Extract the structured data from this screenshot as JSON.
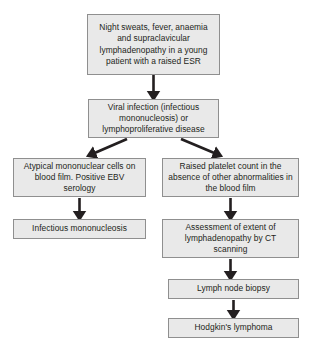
{
  "diagram": {
    "type": "flowchart",
    "background_color": "#ffffff",
    "node_fill_color": "#e9e9e9",
    "node_border_color": "#8f8f8f",
    "text_color": "#231f20",
    "arrow_color": "#231f20",
    "nodes": [
      {
        "id": "presentation",
        "label": "Night sweats, fever, anaemia and supraclavicular lymphadenopathy in a young patient with a raised ESR",
        "x": 87,
        "y": 14,
        "w": 133,
        "h": 61
      },
      {
        "id": "differential",
        "label": "Viral infection (infectious mononucleosis) or lymphoproliferative disease",
        "x": 88,
        "y": 99,
        "w": 131,
        "h": 39
      },
      {
        "id": "left-finding",
        "label": "Atypical mononuclear cells on blood film. Positive EBV serology",
        "x": 13,
        "y": 158,
        "w": 133,
        "h": 39
      },
      {
        "id": "right-finding",
        "label": "Raised platelet count in the absence of other abnormalities in the blood film",
        "x": 162,
        "y": 158,
        "w": 137,
        "h": 39
      },
      {
        "id": "left-diagnosis",
        "label": "Infectious mononucleosis",
        "x": 13,
        "y": 219,
        "w": 133,
        "h": 20
      },
      {
        "id": "ct-assessment",
        "label": "Assessment of extent of lymphadenopathy by CT scanning",
        "x": 162,
        "y": 219,
        "w": 137,
        "h": 39
      },
      {
        "id": "biopsy",
        "label": "Lymph node biopsy",
        "x": 168,
        "y": 279,
        "w": 131,
        "h": 20
      },
      {
        "id": "final-diagnosis",
        "label": "Hodgkin's lymphoma",
        "x": 168,
        "y": 318,
        "w": 131,
        "h": 20
      }
    ],
    "edges": [
      {
        "id": "presentation-to-differential",
        "from": "presentation",
        "to": "differential",
        "x1": 153.5,
        "y1": 75,
        "x2": 153.5,
        "y2": 97
      },
      {
        "id": "differential-to-left-finding",
        "from": "differential",
        "to": "left-finding",
        "x1": 127,
        "y1": 139,
        "x2": 90,
        "y2": 155
      },
      {
        "id": "differential-to-right-finding",
        "from": "differential",
        "to": "right-finding",
        "x1": 181,
        "y1": 139,
        "x2": 219,
        "y2": 155
      },
      {
        "id": "left-finding-to-left-diagnosis",
        "from": "left-finding",
        "to": "left-diagnosis",
        "x1": 79.5,
        "y1": 198,
        "x2": 79.5,
        "y2": 217
      },
      {
        "id": "right-finding-to-ct",
        "from": "right-finding",
        "to": "ct-assessment",
        "x1": 230.5,
        "y1": 198,
        "x2": 230.5,
        "y2": 217
      },
      {
        "id": "ct-to-biopsy",
        "from": "ct-assessment",
        "to": "biopsy",
        "x1": 230.5,
        "y1": 259,
        "x2": 230.5,
        "y2": 277
      },
      {
        "id": "biopsy-to-final",
        "from": "biopsy",
        "to": "final-diagnosis",
        "x1": 233.5,
        "y1": 300,
        "x2": 233.5,
        "y2": 316
      }
    ]
  }
}
